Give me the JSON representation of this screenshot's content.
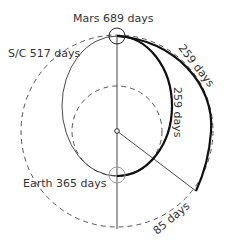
{
  "diagram": {
    "type": "orbital-transfer",
    "labels": {
      "mars": "Mars 689 days",
      "spacecraft": "S/C 517 days",
      "earth": "Earth 365 days",
      "outer_arc": "259 days",
      "inner_arc": "259 days",
      "gap": "85 days"
    },
    "colors": {
      "line": "#333333",
      "thick": "#111111",
      "dashed": "#555555",
      "earth_marker": "#999999",
      "background": "#ffffff"
    }
  }
}
